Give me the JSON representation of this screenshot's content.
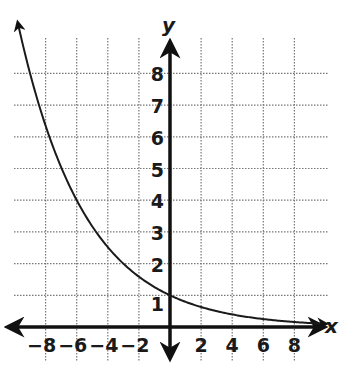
{
  "chart_data": {
    "type": "line",
    "title": "",
    "xlabel": "x",
    "ylabel": "y",
    "xlim": [
      -10,
      10
    ],
    "ylim": [
      0,
      9
    ],
    "grid": true,
    "grid_style": "dotted",
    "x_ticks": [
      -8,
      -6,
      -4,
      -2,
      2,
      4,
      6,
      8
    ],
    "x_tick_labels": [
      "−8",
      "−6",
      "−4",
      "−2",
      "2",
      "4",
      "6",
      "8"
    ],
    "y_ticks": [
      1,
      2,
      3,
      4,
      5,
      6,
      7,
      8
    ],
    "y_tick_labels": [
      "1",
      "2",
      "3",
      "4",
      "5",
      "6",
      "7",
      "8"
    ],
    "series": [
      {
        "name": "exponential decay curve",
        "description": "decreasing exponential through (0, 1), approx y = 2^(-x/3)",
        "x": [
          -9.8,
          -8,
          -6,
          -5,
          -4,
          -3,
          -2,
          0,
          2,
          4,
          6,
          8,
          10
        ],
        "y": [
          9.6,
          6.35,
          4,
          3.17,
          2.52,
          2,
          1.59,
          1,
          0.63,
          0.4,
          0.25,
          0.16,
          0.1
        ],
        "color": "#1a1a1a",
        "arrow_left": true,
        "arrow_right": true
      }
    ],
    "colors": {
      "axis": "#111111",
      "grid": "#777777",
      "curve": "#1a1a1a",
      "background": "#ffffff"
    }
  }
}
